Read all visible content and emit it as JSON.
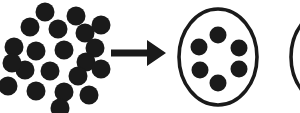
{
  "figure": {
    "background_color": "#ffffff",
    "ink_color": "#1a1a1a",
    "width": 300,
    "height": 113
  },
  "chart_data": {
    "type": "scatter",
    "xlabel": "",
    "ylabel": "",
    "xlim": [
      0,
      300
    ],
    "ylim": [
      0,
      113
    ],
    "grid": false,
    "legend": "none",
    "series": [
      {
        "name": "free-particles-cluster",
        "marker": "filled-circle",
        "color": "#1a1a1a",
        "radius": 9.5,
        "count": 21,
        "points": [
          [
            45,
            12
          ],
          [
            76,
            16
          ],
          [
            30,
            27
          ],
          [
            58,
            29
          ],
          [
            85,
            33
          ],
          [
            101,
            25
          ],
          [
            14,
            47
          ],
          [
            36,
            51
          ],
          [
            64,
            50
          ],
          [
            95,
            48
          ],
          [
            86,
            62
          ],
          [
            25,
            70
          ],
          [
            50,
            71
          ],
          [
            78,
            76
          ],
          [
            101,
            69
          ],
          [
            8,
            86
          ],
          [
            36,
            91
          ],
          [
            64,
            92
          ],
          [
            89,
            95
          ],
          [
            12,
            63
          ],
          [
            60,
            108
          ]
        ]
      },
      {
        "name": "encapsulated-particles",
        "marker": "filled-circle",
        "color": "#1a1a1a",
        "radius": 8.5,
        "count": 6,
        "points": [
          [
            218,
            35
          ],
          [
            199,
            47
          ],
          [
            239,
            48
          ],
          [
            200,
            70
          ],
          [
            239,
            69
          ],
          [
            218,
            83
          ]
        ]
      }
    ],
    "annotations": [
      {
        "name": "transformation-arrow",
        "type": "arrow",
        "direction": "right",
        "label": "",
        "x_start": 111,
        "x_end": 166,
        "y": 53,
        "shaft_thickness": 7,
        "head_length": 19,
        "head_half_width": 13,
        "color": "#1a1a1a"
      },
      {
        "name": "vesicle-outline",
        "type": "circle-outline",
        "label": "",
        "cx": 218,
        "cy": 57,
        "rx": 39,
        "ry": 48,
        "stroke_width": 3.6,
        "color": "#1a1a1a"
      },
      {
        "name": "adjacent-vesicle-outline-clipped",
        "type": "circle-outline",
        "label": "",
        "cx": 330,
        "cy": 57,
        "rx": 39,
        "ry": 48,
        "stroke_width": 3.6,
        "color": "#1a1a1a",
        "clipped": true
      }
    ]
  }
}
